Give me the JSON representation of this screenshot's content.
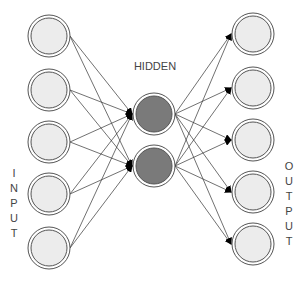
{
  "diagram": {
    "type": "neural-network-autoencoder",
    "labels": {
      "hidden": "HIDDEN",
      "input": "INPUT",
      "output": "OUTPUT"
    },
    "colors": {
      "input_fill": "#ececec",
      "output_fill": "#ececec",
      "hidden_fill": "#7a7a7a",
      "ring_stroke": "#555555",
      "edge_stroke": "#333333",
      "arrow_fill": "#000000",
      "text": "#444444"
    },
    "layers": {
      "input": {
        "count": 5,
        "x": 49,
        "y": [
          36,
          90,
          142,
          194,
          248
        ]
      },
      "hidden": {
        "count": 2,
        "x": 154,
        "y": [
          114,
          166
        ]
      },
      "output": {
        "count": 5,
        "x": 253,
        "y": [
          34,
          88,
          140,
          192,
          244
        ]
      }
    },
    "node_radius": 21,
    "connections": "fully-connected input→hidden, hidden→output, arrowheads at target"
  }
}
